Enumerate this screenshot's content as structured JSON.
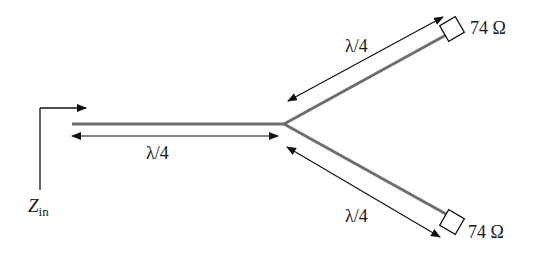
{
  "diagram": {
    "type": "quarter-wave power divider",
    "colors": {
      "line": "#6e6e6e",
      "arrow": "#111111",
      "background": "#ffffff"
    },
    "input": {
      "label_main": "Z",
      "label_sub": "in"
    },
    "main_section": {
      "length_label": "λ/4"
    },
    "upper_branch": {
      "length_label": "λ/4",
      "load_label": "74 Ω"
    },
    "lower_branch": {
      "length_label": "λ/4",
      "load_label": "74 Ω"
    }
  }
}
